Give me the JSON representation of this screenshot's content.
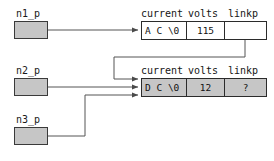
{
  "diagram": {
    "colors": {
      "node_fill_gray": "#c6c6c6",
      "node_fill_white": "#ffffff",
      "stroke": "#2b2b2b",
      "wire": "#555555",
      "background": "#ffffff"
    },
    "pointers": [
      {
        "id": "n1",
        "label": "n1_p"
      },
      {
        "id": "n2",
        "label": "n2_p"
      },
      {
        "id": "n3",
        "label": "n3_p"
      }
    ],
    "headers": {
      "current": "current",
      "volts": "volts",
      "linkp": "linkp"
    },
    "nodes": [
      {
        "id": "node-a",
        "fill": "white",
        "current": "A C \\0",
        "volts": "115",
        "linkp": ""
      },
      {
        "id": "node-d",
        "fill": "gray",
        "current": "D C \\0",
        "volts": "12",
        "linkp": "?"
      }
    ],
    "connections": [
      {
        "from": "n1_p",
        "to": "node-a"
      },
      {
        "from": "node-a.linkp",
        "to": "node-d"
      },
      {
        "from": "n2_p",
        "to": "node-d"
      },
      {
        "from": "n3_p",
        "to": "node-d"
      }
    ]
  }
}
